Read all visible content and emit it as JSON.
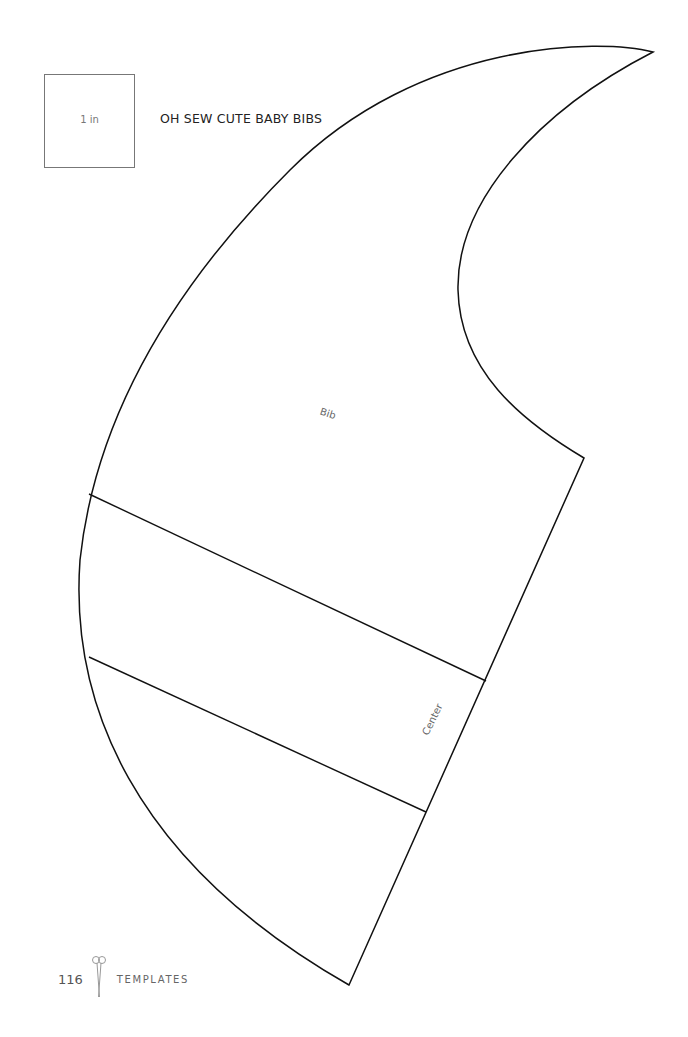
{
  "scale_reference": {
    "label": "1 in"
  },
  "title": "OH SEW CUTE BABY BIBS",
  "pattern": {
    "pieces": [
      {
        "label": "Bib"
      },
      {
        "label": "Center"
      }
    ],
    "stroke_color": "#111111"
  },
  "footer": {
    "page_number": "116",
    "section": "TEMPLATES",
    "icon": "scissors-icon"
  }
}
